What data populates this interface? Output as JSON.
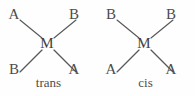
{
  "figure": {
    "background_color": "#fefefe",
    "line_color": "#58585a",
    "text_color": "#4c4c4e",
    "diagrams": [
      {
        "name": "trans",
        "label": "trans",
        "center_atom": "M",
        "ligands": {
          "top_left": "A",
          "top_right": "B",
          "bottom_left": "B",
          "bottom_right": "A"
        }
      },
      {
        "name": "cis",
        "label": "cis",
        "center_atom": "M",
        "ligands": {
          "top_left": "B",
          "top_right": "B",
          "bottom_left": "A",
          "bottom_right": "A"
        }
      }
    ]
  }
}
